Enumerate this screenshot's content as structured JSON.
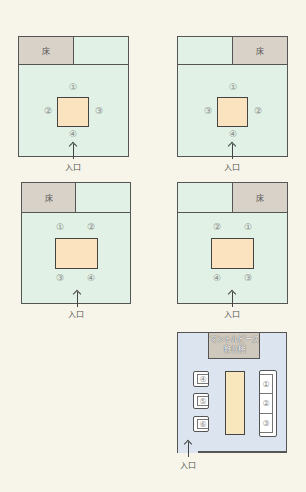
{
  "labels": {
    "toko": "床",
    "entrance": "入口",
    "mantel_line1": "マントルピース",
    "mantel_line2": "飾り棚"
  },
  "diagrams": [
    {
      "id": "washitsu-square-toko-left",
      "toko_position": "left",
      "table_shape": "square",
      "seats": {
        "top": "①",
        "left": "②",
        "right": "③",
        "bottom": "④"
      }
    },
    {
      "id": "washitsu-square-toko-right",
      "toko_position": "right",
      "table_shape": "square",
      "seats": {
        "top": "①",
        "left": "③",
        "right": "②",
        "bottom": "④"
      }
    },
    {
      "id": "washitsu-rect-toko-left",
      "toko_position": "left",
      "table_shape": "rectangle",
      "seats": {
        "top_left": "①",
        "top_right": "②",
        "bottom_left": "③",
        "bottom_right": "④"
      }
    },
    {
      "id": "washitsu-rect-toko-right",
      "toko_position": "right",
      "table_shape": "rectangle",
      "seats": {
        "top_left": "②",
        "top_right": "①",
        "bottom_left": "④",
        "bottom_right": "③"
      }
    },
    {
      "id": "yoshitsu-living",
      "sofa_seats": [
        "①",
        "②",
        "③"
      ],
      "armchair_seats": [
        "④",
        "⑤",
        "⑥"
      ]
    }
  ],
  "colors": {
    "background": "#f7f5e9",
    "room_washitsu": "#e1f1e5",
    "room_yoshitsu": "#dce5ef",
    "toko": "#d8d2c8",
    "table": "#fbe3c0",
    "border": "#555555"
  }
}
